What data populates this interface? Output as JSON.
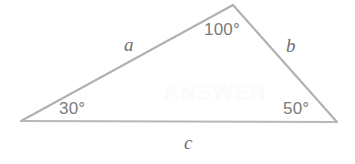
{
  "figure": {
    "type": "triangle-diagram",
    "background_color": "#ffffff",
    "stroke_color": "#b2b2b2",
    "text_color": "#7b7b7b",
    "vertices": {
      "left": {
        "x": 21,
        "y": 121
      },
      "apex": {
        "x": 233,
        "y": 5
      },
      "right": {
        "x": 337,
        "y": 122
      }
    },
    "angles": {
      "apex_label": "100°",
      "left_label": "30°",
      "right_label": "50°"
    },
    "sides": {
      "a_label": "a",
      "b_label": "b",
      "c_label": "c"
    },
    "watermark": "ANSWER"
  }
}
